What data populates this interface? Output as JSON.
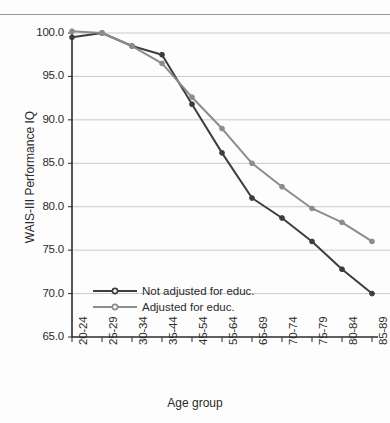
{
  "chart_data": {
    "type": "line",
    "title": "",
    "xlabel": "Age group",
    "ylabel": "WAIS-III Performance IQ",
    "categories": [
      "20-24",
      "25-29",
      "30-34",
      "35-44",
      "45-54",
      "55-64",
      "65-69",
      "70-74",
      "75-79",
      "80-84",
      "85-89"
    ],
    "ylim": [
      65.0,
      100.0
    ],
    "ytick_labels": [
      "100.0",
      "95.0",
      "90.0",
      "85.0",
      "80.0",
      "75.0",
      "70.0",
      "65.0"
    ],
    "yticks": [
      100.0,
      95.0,
      90.0,
      85.0,
      80.0,
      75.0,
      70.0,
      65.0
    ],
    "grid": true,
    "legend_position": "inside-lower-left",
    "series": [
      {
        "name": "Not adjusted for educ.",
        "color": "#3d3d3d",
        "values": [
          99.5,
          100.0,
          98.5,
          97.5,
          91.8,
          86.2,
          81.0,
          78.7,
          76.0,
          72.8,
          70.0
        ]
      },
      {
        "name": "Adjusted for educ.",
        "color": "#8c8c8c",
        "values": [
          100.2,
          100.0,
          98.5,
          96.5,
          92.6,
          89.0,
          85.0,
          82.3,
          79.8,
          78.2,
          76.0
        ]
      }
    ]
  },
  "axis": {
    "y_title": "WAIS-III Performance IQ",
    "x_title": "Age group"
  },
  "legend": {
    "items": [
      {
        "label": "Not adjusted for educ.",
        "color": "#3d3d3d"
      },
      {
        "label": "Adjusted for educ.",
        "color": "#8c8c8c"
      }
    ]
  },
  "colors": {
    "series_dark": "#3d3d3d",
    "series_light": "#8c8c8c",
    "gridline": "#c9c9c9",
    "axis": "#2b2b2b",
    "background": "#fdfdfd"
  }
}
